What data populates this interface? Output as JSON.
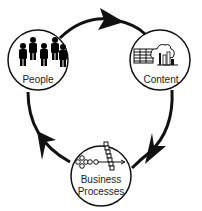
{
  "diagram": {
    "type": "cycle",
    "direction": "clockwise",
    "colors": {
      "stroke": "#111111",
      "fill": "#ffffff",
      "text": "#222222"
    },
    "nodes": [
      {
        "id": "people",
        "label": "People",
        "icon": "people-group-icon"
      },
      {
        "id": "content",
        "label": "Content",
        "icon": "spreadsheet-cloud-chart-icon"
      },
      {
        "id": "business",
        "label_line1": "Business",
        "label_line2": "Processes",
        "icon": "process-flow-icon"
      }
    ],
    "edges": [
      {
        "from": "people",
        "to": "content"
      },
      {
        "from": "content",
        "to": "business"
      },
      {
        "from": "business",
        "to": "people"
      }
    ]
  }
}
